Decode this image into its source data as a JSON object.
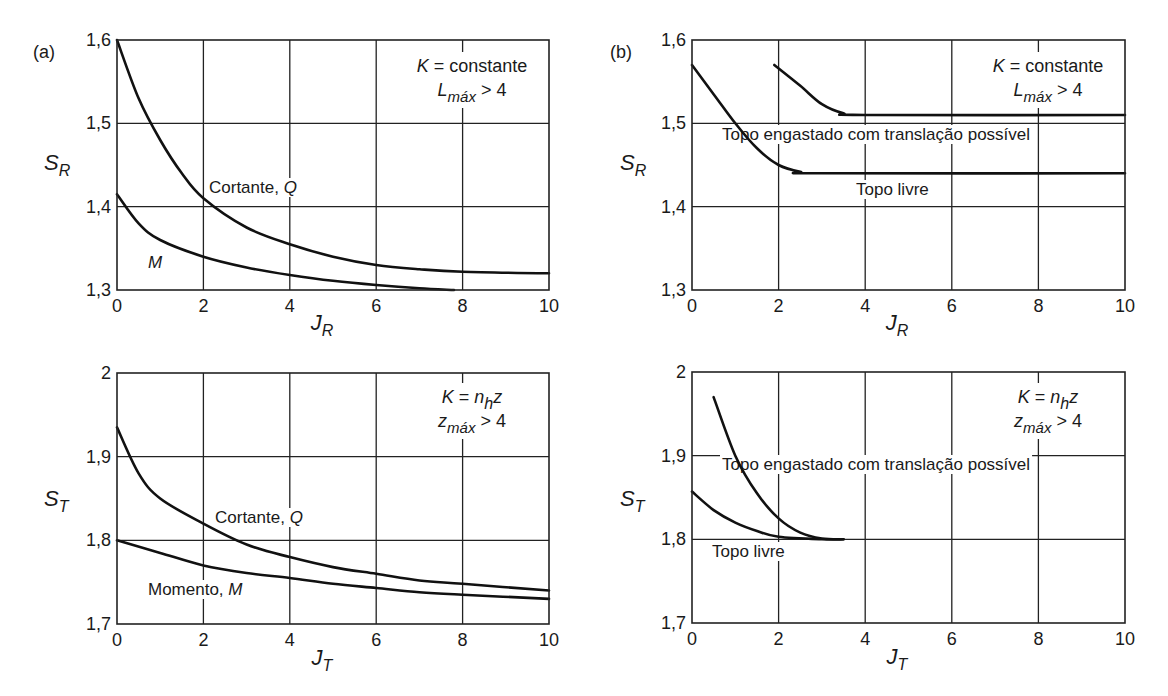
{
  "figure": {
    "panel_tags": [
      "(a)",
      "(b)"
    ]
  },
  "chart_data": [
    {
      "id": "a-top",
      "type": "line",
      "panel": "(a)",
      "xlabel": "J_R",
      "xlabel_main": "J",
      "xlabel_sub": "R",
      "ylabel": "S_R",
      "ylabel_main": "S",
      "ylabel_sub": "R",
      "xlim": [
        0,
        10
      ],
      "ylim": [
        1.3,
        1.6
      ],
      "x_ticks": [
        "0",
        "2",
        "4",
        "6",
        "8",
        "10"
      ],
      "y_ticks": [
        "1,3",
        "1,4",
        "1,5",
        "1,6"
      ],
      "grid": true,
      "annotation": {
        "line1_var": "K",
        "line1_rest": " = constante",
        "line2_var": "L",
        "line2_sub": "máx",
        "line2_rest": " > 4"
      },
      "series": [
        {
          "name": "Cortante, Q",
          "label_main": "Cortante, ",
          "label_var": "Q",
          "x": [
            0,
            0.5,
            1,
            1.5,
            2,
            3,
            4,
            5,
            6,
            7,
            8,
            10
          ],
          "y": [
            1.6,
            1.53,
            1.48,
            1.44,
            1.41,
            1.375,
            1.355,
            1.34,
            1.33,
            1.325,
            1.322,
            1.32
          ]
        },
        {
          "name": "M",
          "label_main": "",
          "label_var": "M",
          "x": [
            0,
            0.5,
            1,
            2,
            3,
            4,
            5,
            6,
            7,
            7.8
          ],
          "y": [
            1.415,
            1.38,
            1.36,
            1.34,
            1.327,
            1.318,
            1.311,
            1.306,
            1.302,
            1.3
          ]
        }
      ]
    },
    {
      "id": "b-top",
      "type": "line",
      "panel": "(b)",
      "xlabel": "J_R",
      "xlabel_main": "J",
      "xlabel_sub": "R",
      "ylabel": "S_R",
      "ylabel_main": "S",
      "ylabel_sub": "R",
      "xlim": [
        0,
        10
      ],
      "ylim": [
        1.3,
        1.6
      ],
      "x_ticks": [
        "0",
        "2",
        "4",
        "6",
        "8",
        "10"
      ],
      "y_ticks": [
        "1,3",
        "1,4",
        "1,5",
        "1,6"
      ],
      "grid": true,
      "annotation": {
        "line1_var": "K",
        "line1_rest": " = constante",
        "line2_var": "L",
        "line2_sub": "máx",
        "line2_rest": " > 4"
      },
      "series": [
        {
          "name": "Topo engastado com translação possível",
          "x": [
            1.9,
            2.5,
            3,
            3.5,
            4,
            10
          ],
          "y": [
            1.57,
            1.545,
            1.523,
            1.512,
            1.51,
            1.51
          ]
        },
        {
          "name": "Topo livre",
          "x": [
            0,
            0.5,
            1,
            1.5,
            2,
            2.5,
            3,
            10
          ],
          "y": [
            1.57,
            1.535,
            1.5,
            1.47,
            1.45,
            1.442,
            1.44,
            1.44
          ]
        }
      ]
    },
    {
      "id": "a-bottom",
      "type": "line",
      "panel": "(a)",
      "xlabel": "J_T",
      "xlabel_main": "J",
      "xlabel_sub": "T",
      "ylabel": "S_T",
      "ylabel_main": "S",
      "ylabel_sub": "T",
      "xlim": [
        0,
        10
      ],
      "ylim": [
        1.7,
        2.0
      ],
      "x_ticks": [
        "0",
        "2",
        "4",
        "6",
        "8",
        "10"
      ],
      "y_ticks": [
        "1,7",
        "1,8",
        "1,9",
        "2"
      ],
      "grid": true,
      "annotation": {
        "line1_var": "K",
        "line1_rest": " = ",
        "line1_var2": "n",
        "line1_sub2": "h",
        "line1_var3": "z",
        "line2_var": "z",
        "line2_sub": "máx",
        "line2_rest": " > 4"
      },
      "series": [
        {
          "name": "Cortante, Q",
          "label_main": "Cortante, ",
          "label_var": "Q",
          "x": [
            0,
            0.5,
            1,
            2,
            3,
            4,
            5,
            6,
            7,
            8,
            10
          ],
          "y": [
            1.935,
            1.88,
            1.85,
            1.82,
            1.795,
            1.78,
            1.768,
            1.76,
            1.752,
            1.748,
            1.74
          ]
        },
        {
          "name": "Momento, M",
          "label_main": "Momento, ",
          "label_var": "M",
          "x": [
            0,
            1,
            2,
            3,
            4,
            5,
            6,
            7,
            8,
            10
          ],
          "y": [
            1.8,
            1.785,
            1.77,
            1.761,
            1.755,
            1.748,
            1.743,
            1.738,
            1.735,
            1.73
          ]
        }
      ]
    },
    {
      "id": "b-bottom",
      "type": "line",
      "panel": "(b)",
      "xlabel": "J_T",
      "xlabel_main": "J",
      "xlabel_sub": "T",
      "ylabel": "S_T",
      "ylabel_main": "S",
      "ylabel_sub": "T",
      "xlim": [
        0,
        10
      ],
      "ylim": [
        1.7,
        2.0
      ],
      "x_ticks": [
        "0",
        "2",
        "4",
        "6",
        "8",
        "10"
      ],
      "y_ticks": [
        "1,7",
        "1,8",
        "1,9",
        "2"
      ],
      "grid": true,
      "annotation": {
        "line1_var": "K",
        "line1_rest": " = ",
        "line1_var2": "n",
        "line1_sub2": "h",
        "line1_var3": "z",
        "line2_var": "z",
        "line2_sub": "máx",
        "line2_rest": " > 4"
      },
      "series": [
        {
          "name": "Topo engastado com translação possível",
          "x": [
            0.5,
            1,
            1.5,
            2,
            2.5,
            3,
            3.5
          ],
          "y": [
            1.97,
            1.9,
            1.855,
            1.825,
            1.808,
            1.801,
            1.8
          ]
        },
        {
          "name": "Topo livre",
          "x": [
            0,
            0.5,
            1,
            1.5,
            2,
            3,
            3.5
          ],
          "y": [
            1.857,
            1.835,
            1.82,
            1.81,
            1.803,
            1.8,
            1.8
          ]
        }
      ]
    }
  ]
}
